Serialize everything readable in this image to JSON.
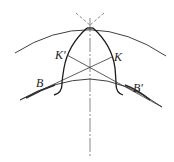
{
  "diagram": {
    "type": "gear-tooth-contact-geometry",
    "labels": {
      "k_prime": "K′",
      "k": "K",
      "b": "B",
      "b_prime": "B′"
    },
    "colors": {
      "stroke": "#2a2a2a",
      "background": "#ffffff"
    }
  }
}
